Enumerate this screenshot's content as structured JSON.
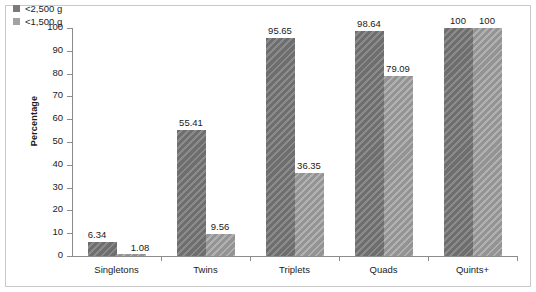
{
  "chart_data": {
    "type": "bar",
    "title": "",
    "subtitle": "",
    "xlabel": "",
    "ylabel": "Percentage",
    "ylim": [
      0,
      100
    ],
    "ytick_step": 10,
    "yticks": [
      0,
      10,
      20,
      30,
      40,
      50,
      60,
      70,
      80,
      90,
      100
    ],
    "ytick_labels": [
      "0",
      "10",
      "20",
      "30",
      "40",
      "50",
      "60",
      "70",
      "80",
      "90",
      "100"
    ],
    "grid": false,
    "legend_position": "top-left",
    "categories": [
      "Singletons",
      "Twins",
      "Triplets",
      "Quads",
      "Quints+"
    ],
    "series": [
      {
        "name": "<2,500 g",
        "color": "#7a7a7a",
        "values": [
          6.34,
          55.41,
          95.65,
          98.64,
          100
        ],
        "value_labels": [
          "6.34",
          "55.41",
          "95.65",
          "98.64",
          "100"
        ]
      },
      {
        "name": "<1,500 g",
        "color": "#a2a2a2",
        "values": [
          1.08,
          9.56,
          36.35,
          79.09,
          100
        ],
        "value_labels": [
          "1.08",
          "9.56",
          "36.35",
          "79.09",
          "100"
        ]
      }
    ]
  },
  "legend": {
    "items": [
      {
        "label": "<2,500 g",
        "swatch": "legend-swatch-series-1"
      },
      {
        "label": "<1,500 g",
        "swatch": "legend-swatch-series-2"
      }
    ]
  },
  "axes": {
    "y_title": "Percentage"
  }
}
